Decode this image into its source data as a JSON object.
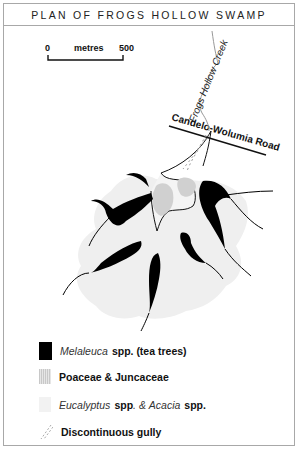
{
  "title": "PLAN OF FROGS HOLLOW SWAMP",
  "scale_bar": {
    "start_label": "0",
    "unit_label": "metres",
    "end_label": "500"
  },
  "map_labels": {
    "creek": "Frogs Hollow Creek",
    "road": "Candelo-Wolumia Road"
  },
  "colors": {
    "melaleuca": "#000000",
    "poaceae": "#cfcfcf",
    "eucalyptus": "#eeeeee",
    "creek_line": "#999999",
    "gully": "#aaaaaa",
    "border": "#a8a8a8"
  },
  "legend": {
    "melaleuca": {
      "genus": "Melaleuca",
      "suffix": "spp. (tea trees)"
    },
    "poaceae": {
      "label": "Poaceae  & Juncaceae"
    },
    "eucalyptus": {
      "genus1": "Eucalyptus",
      "spp1": "spp",
      "mid": ". & ",
      "genus2": "Acacia",
      "spp2": "spp."
    },
    "gully": {
      "label": "Discontinuous gully"
    }
  }
}
